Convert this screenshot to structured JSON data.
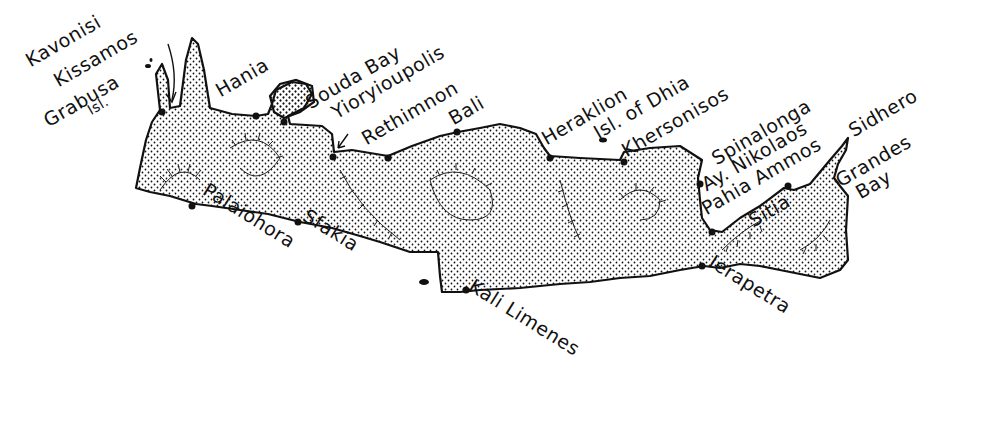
{
  "map": {
    "region": "Crete",
    "colors": {
      "land_stipple": "#111111",
      "coast": "#111111",
      "sea": "#ffffff",
      "text": "#111111"
    },
    "places": [
      {
        "id": "kavonisi-kissamos",
        "label": "Kavonisi",
        "x": 32,
        "y": 70,
        "rot": -30
      },
      {
        "id": "kissamos",
        "label": "Kissamos",
        "x": 60,
        "y": 90,
        "rot": -30
      },
      {
        "id": "grabusa",
        "label": "Grabusa",
        "x": 50,
        "y": 130,
        "rot": -30
      },
      {
        "id": "grabusa-isl",
        "label": "Isl.",
        "x": 92,
        "y": 122,
        "rot": -30
      },
      {
        "id": "hania",
        "label": "Hania",
        "x": 222,
        "y": 100,
        "rot": -30
      },
      {
        "id": "souda-bay",
        "label": "Souda Bay",
        "x": 312,
        "y": 112,
        "rot": -30
      },
      {
        "id": "yioryioupolis",
        "label": "Yioryioupolis",
        "x": 338,
        "y": 122,
        "rot": -30
      },
      {
        "id": "rethimnon",
        "label": "Rethimnon",
        "x": 368,
        "y": 148,
        "rot": -30
      },
      {
        "id": "bali",
        "label": "Bali",
        "x": 455,
        "y": 128,
        "rot": -30
      },
      {
        "id": "heraklion",
        "label": "Heraklion",
        "x": 548,
        "y": 148,
        "rot": -30
      },
      {
        "id": "isl-of-dhia",
        "label": "Isl. of Dhia",
        "x": 600,
        "y": 142,
        "rot": -30
      },
      {
        "id": "khersonisos",
        "label": "Khersonisos",
        "x": 628,
        "y": 160,
        "rot": -30
      },
      {
        "id": "spinalonga",
        "label": "Spinalonga",
        "x": 718,
        "y": 168,
        "rot": -30
      },
      {
        "id": "ay-nikolaos",
        "label": "Ay. Nikolaos",
        "x": 708,
        "y": 194,
        "rot": -30
      },
      {
        "id": "pahia-ammos",
        "label": "Pahia Ammos",
        "x": 708,
        "y": 218,
        "rot": -30
      },
      {
        "id": "sitia",
        "label": "Sitia",
        "x": 755,
        "y": 230,
        "rot": -30
      },
      {
        "id": "sidhero",
        "label": "Sidhero",
        "x": 855,
        "y": 140,
        "rot": -30
      },
      {
        "id": "grandes",
        "label": "Grandes",
        "x": 842,
        "y": 190,
        "rot": -30
      },
      {
        "id": "grandes-bay",
        "label": "Bay",
        "x": 862,
        "y": 202,
        "rot": -30
      },
      {
        "id": "palaiohora",
        "label": "Palaiohora",
        "x": 200,
        "y": 196,
        "rot": 32
      },
      {
        "id": "sfakia",
        "label": "Sfakia",
        "x": 300,
        "y": 222,
        "rot": 32
      },
      {
        "id": "kali-limenes",
        "label": "Kali Limenes",
        "x": 466,
        "y": 292,
        "rot": 32
      },
      {
        "id": "ierapetra",
        "label": "Ierapetra",
        "x": 706,
        "y": 268,
        "rot": 32
      }
    ],
    "towns": [
      [
        162,
        112
      ],
      [
        256,
        116
      ],
      [
        284,
        122
      ],
      [
        333,
        157
      ],
      [
        388,
        158
      ],
      [
        457,
        132
      ],
      [
        550,
        158
      ],
      [
        624,
        162
      ],
      [
        700,
        184
      ],
      [
        712,
        232
      ],
      [
        788,
        186
      ],
      [
        192,
        206
      ],
      [
        298,
        222
      ],
      [
        466,
        290
      ],
      [
        702,
        266
      ]
    ]
  }
}
